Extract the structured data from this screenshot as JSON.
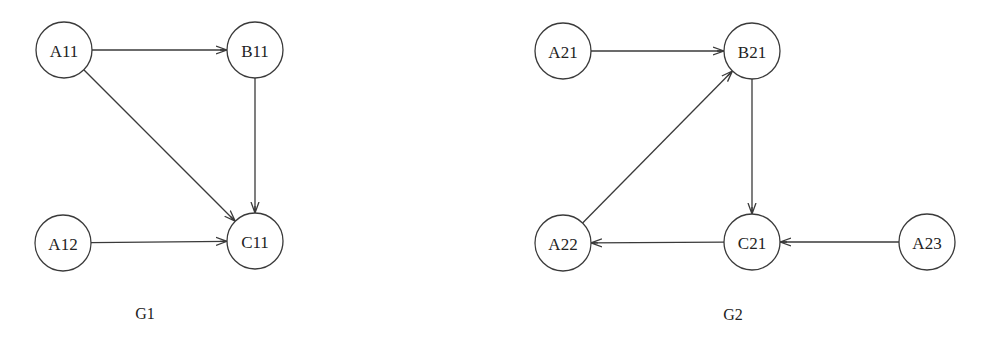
{
  "diagram": {
    "style": {
      "stroke_color": "#3a3a3a",
      "text_color": "#222222",
      "background": "#ffffff",
      "node_radius": 28
    },
    "graphs": [
      {
        "id": "G1",
        "caption": "G1",
        "caption_pos": [
          145,
          313
        ],
        "nodes": [
          {
            "id": "A11",
            "label": "A11",
            "x": 64,
            "y": 50
          },
          {
            "id": "B11",
            "label": "B11",
            "x": 255,
            "y": 50
          },
          {
            "id": "A12",
            "label": "A12",
            "x": 63,
            "y": 243
          },
          {
            "id": "C11",
            "label": "C11",
            "x": 255,
            "y": 241
          }
        ],
        "edges": [
          {
            "from": "A11",
            "to": "B11"
          },
          {
            "from": "A11",
            "to": "C11"
          },
          {
            "from": "B11",
            "to": "C11"
          },
          {
            "from": "A12",
            "to": "C11"
          }
        ]
      },
      {
        "id": "G2",
        "caption": "G2",
        "caption_pos": [
          733,
          314
        ],
        "nodes": [
          {
            "id": "A21",
            "label": "A21",
            "x": 563,
            "y": 51
          },
          {
            "id": "B21",
            "label": "B21",
            "x": 752,
            "y": 51
          },
          {
            "id": "A22",
            "label": "A22",
            "x": 563,
            "y": 243
          },
          {
            "id": "C21",
            "label": "C21",
            "x": 752,
            "y": 242
          },
          {
            "id": "A23",
            "label": "A23",
            "x": 927,
            "y": 242
          }
        ],
        "edges": [
          {
            "from": "A21",
            "to": "B21"
          },
          {
            "from": "A22",
            "to": "B21"
          },
          {
            "from": "B21",
            "to": "C21"
          },
          {
            "from": "C21",
            "to": "A22"
          },
          {
            "from": "A23",
            "to": "C21"
          }
        ]
      }
    ]
  }
}
